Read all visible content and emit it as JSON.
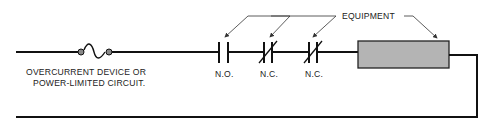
{
  "diagram": {
    "type": "circuit-schematic",
    "labels": {
      "overcurrent_line1": "OVERCURRENT DEVICE OR",
      "overcurrent_line2": "POWER-LIMITED CIRCUIT.",
      "equipment": "EQUIPMENT",
      "contact_1": "N.O.",
      "contact_2": "N.C.",
      "contact_3": "N.C."
    },
    "components": [
      {
        "id": "fuse",
        "kind": "overcurrent-device"
      },
      {
        "id": "contact_1",
        "kind": "normally-open-contact"
      },
      {
        "id": "contact_2",
        "kind": "normally-closed-contact"
      },
      {
        "id": "contact_3",
        "kind": "normally-closed-contact"
      },
      {
        "id": "load",
        "kind": "equipment-box"
      }
    ],
    "colors": {
      "wire": "#111111",
      "load_fill": "#b4b4b4",
      "text": "#222222"
    }
  }
}
